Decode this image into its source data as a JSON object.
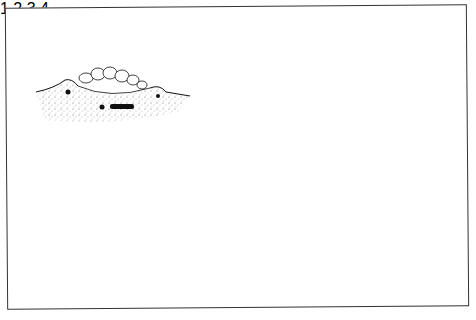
{
  "figure": {
    "title": "",
    "panels": [
      {
        "label": "1",
        "description": "shallow mound, animal crouched in surface depression"
      },
      {
        "label": "2",
        "description": "animal building arched wall of pellets over itself"
      },
      {
        "label": "3",
        "description": "completed dome chamber enclosing coiled animal"
      },
      {
        "label": "4",
        "description": "tall stippled mound with chamber at base, animal inside"
      }
    ]
  },
  "colors": {
    "ink": "#111111",
    "stipple": "#555555",
    "background": "#ffffff",
    "frame": "#333333"
  }
}
